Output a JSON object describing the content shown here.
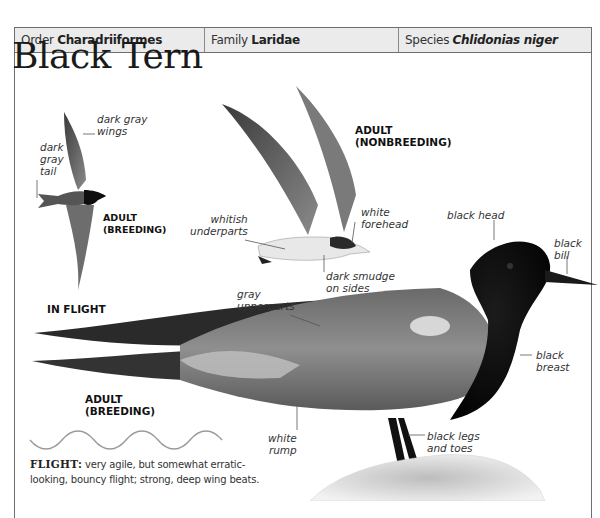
{
  "header": {
    "order_prefix": "Order",
    "order": "Charadriiformes",
    "family_prefix": "Family",
    "family": "Laridae",
    "species_prefix": "Species",
    "species": "Chlidonias niger"
  },
  "title": "Black Tern",
  "flight_illustration": {
    "labels": {
      "wings": "dark gray\nwings",
      "tail": "dark\ngray\ntail"
    },
    "caption": "ADULT\n(BREEDING)",
    "section_label": "IN FLIGHT"
  },
  "nonbreeding_illustration": {
    "caption": "ADULT\n(NONBREEDING)",
    "labels": {
      "underparts": "whitish\nunderparts",
      "forehead": "white\nforehead",
      "sides": "dark smudge\non sides"
    }
  },
  "perched_illustration": {
    "caption": "ADULT\n(BREEDING)",
    "labels": {
      "head": "black head",
      "bill": "black\nbill",
      "upperparts": "gray\nupperparts",
      "breast": "black\nbreast",
      "rump": "white\nrump",
      "legs": "black legs\nand toes"
    }
  },
  "flight_description": {
    "heading": "FLIGHT:",
    "text": " very agile, but somewhat erratic-looking, bouncy flight; strong, deep wing beats."
  },
  "colors": {
    "header_bg": "#ebebeb",
    "border": "#6e6e6e",
    "plumage_black": "#111111",
    "plumage_gray": "#7d7d7d",
    "wave_line": "#9a9a9a"
  }
}
